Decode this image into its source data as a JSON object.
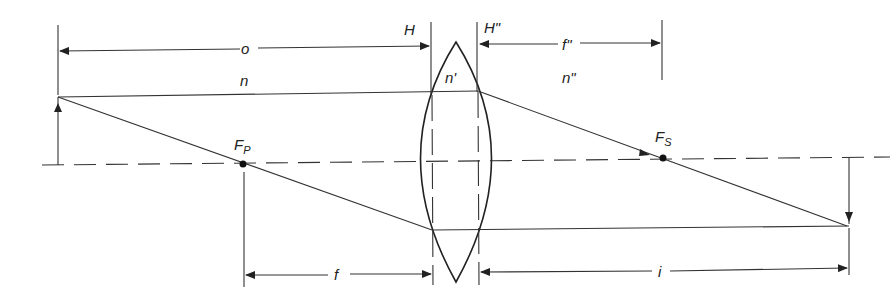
{
  "diagram": {
    "labels": {
      "object_distance": "o",
      "image_distance": "i",
      "front_focal_length": "f",
      "back_focal_length": "f\"",
      "principal_plane_front": "H",
      "principal_plane_back": "H\"",
      "medium_object": "n",
      "medium_lens": "n'",
      "medium_image": "n\"",
      "focal_point_primary": "F",
      "focal_point_primary_sub": "P",
      "focal_point_secondary": "F",
      "focal_point_secondary_sub": "S"
    },
    "colors": {
      "line": "#333333",
      "background": "#ffffff"
    }
  }
}
